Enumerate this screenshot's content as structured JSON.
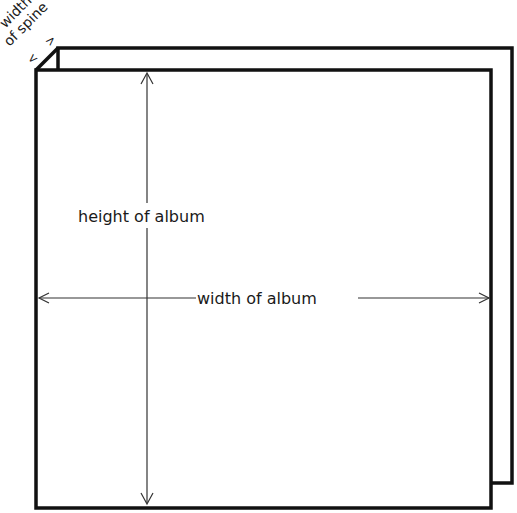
{
  "diagram": {
    "title_clipped": "",
    "labels": {
      "spine_line1": "width",
      "spine_line2": "of spine",
      "spine_arrow_left": "<",
      "spine_arrow_right": ">",
      "height": "height of album",
      "width": "width of album"
    },
    "colors": {
      "stroke": "#111111",
      "background": "#ffffff",
      "arrow": "#333333"
    },
    "geometry": {
      "back_panel": {
        "x1": 58,
        "y1": 48,
        "x2": 512,
        "y2": 483
      },
      "front_panel": {
        "x1": 36,
        "y1": 70,
        "x2": 491,
        "y2": 508
      },
      "height_arrow": {
        "x": 147,
        "y1": 72,
        "y2": 505
      },
      "width_arrow": {
        "y": 298,
        "x1": 38,
        "x2": 490
      }
    }
  }
}
